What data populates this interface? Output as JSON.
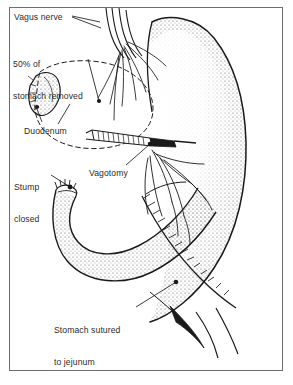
{
  "figure": {
    "domain": "medical-illustration",
    "background_color": "#ffffff",
    "ink_color": "#1a1a1a",
    "frame_color": "#6e6e6e",
    "text_color": "#2b2b2b"
  },
  "labels": [
    {
      "id": "vagus-nerve",
      "text": "Vagus nerve",
      "x": 14,
      "y": 12
    },
    {
      "id": "fifty-percent",
      "line1": "50% of",
      "line2": "stomach removed",
      "x": 13,
      "y": 38
    },
    {
      "id": "duodenum",
      "text": "Duodenum",
      "x": 24,
      "y": 126
    },
    {
      "id": "stump-closed",
      "line1": "Stump",
      "line2": "closed",
      "x": 14,
      "y": 161
    },
    {
      "id": "vagotomy",
      "text": "Vagotomy",
      "x": 89,
      "y": 168
    },
    {
      "id": "stomach-sutured",
      "line1": "Stomach sutured",
      "line2": "to jejunum",
      "x": 54,
      "y": 304
    }
  ],
  "structures": [
    {
      "id": "stomach",
      "name": "stomach-body",
      "shading": "stipple"
    },
    {
      "id": "esophagus",
      "name": "esophagus",
      "shading": "line"
    },
    {
      "id": "vagus-branches",
      "name": "vagus-nerve-branches",
      "count": 7
    },
    {
      "id": "resection-outline",
      "name": "removed-stomach-outline",
      "style": "dashed"
    },
    {
      "id": "duodenal-stump",
      "name": "duodenal-stump",
      "shading": "stipple"
    },
    {
      "id": "jejunum",
      "name": "jejunal-loop",
      "shading": "stipple"
    },
    {
      "id": "anastomosis",
      "name": "suture-line",
      "style": "zigzag-stitches"
    },
    {
      "id": "clamp",
      "name": "surgical-clamp",
      "style": "hatched"
    },
    {
      "id": "vessels",
      "name": "mesenteric-vessels",
      "count": 9
    }
  ]
}
